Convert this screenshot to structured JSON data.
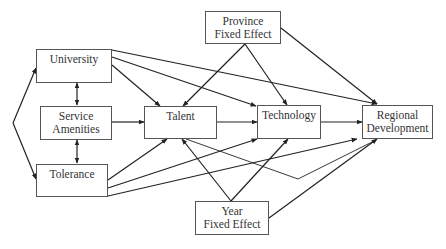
{
  "diagram": {
    "type": "path-model",
    "nodes": {
      "university": {
        "label": "University"
      },
      "service_amenities": {
        "line1": "Service",
        "line2": "Amenities"
      },
      "tolerance": {
        "label": "Tolerance"
      },
      "talent": {
        "label": "Talent"
      },
      "technology": {
        "label": "Technology"
      },
      "regional_development": {
        "line1": "Regional",
        "line2": "Development"
      },
      "province_fixed_effect": {
        "line1": "Province",
        "line2": "Fixed Effect"
      },
      "year_fixed_effect": {
        "line1": "Year",
        "line2": "Fixed Effect"
      }
    },
    "edges": [
      {
        "from": "University",
        "to": "Service Amenities",
        "kind": "bidirectional"
      },
      {
        "from": "Service Amenities",
        "to": "Tolerance",
        "kind": "bidirectional"
      },
      {
        "from": "(common origin)",
        "to": "University",
        "kind": "directed"
      },
      {
        "from": "(common origin)",
        "to": "Tolerance",
        "kind": "directed"
      },
      {
        "from": "University",
        "to": "Talent",
        "kind": "directed"
      },
      {
        "from": "University",
        "to": "Technology",
        "kind": "directed"
      },
      {
        "from": "University",
        "to": "Regional Development",
        "kind": "directed"
      },
      {
        "from": "Service Amenities",
        "to": "Talent",
        "kind": "directed"
      },
      {
        "from": "Tolerance",
        "to": "Talent",
        "kind": "directed"
      },
      {
        "from": "Tolerance",
        "to": "Technology",
        "kind": "directed"
      },
      {
        "from": "Tolerance",
        "to": "Regional Development",
        "kind": "directed"
      },
      {
        "from": "Talent",
        "to": "Technology",
        "kind": "directed"
      },
      {
        "from": "Talent",
        "to": "Regional Development",
        "kind": "directed (bent path)"
      },
      {
        "from": "Technology",
        "to": "Regional Development",
        "kind": "directed"
      },
      {
        "from": "Province Fixed Effect",
        "to": "Talent",
        "kind": "directed"
      },
      {
        "from": "Province Fixed Effect",
        "to": "Technology",
        "kind": "directed"
      },
      {
        "from": "Province Fixed Effect",
        "to": "Regional Development",
        "kind": "directed"
      },
      {
        "from": "Year Fixed Effect",
        "to": "Talent",
        "kind": "directed"
      },
      {
        "from": "Year Fixed Effect",
        "to": "Technology",
        "kind": "directed"
      },
      {
        "from": "Year Fixed Effect",
        "to": "Regional Development",
        "kind": "directed"
      }
    ],
    "colors": {
      "line": "#222222",
      "box_border": "#555555",
      "text": "#333333",
      "background": "#ffffff"
    }
  }
}
